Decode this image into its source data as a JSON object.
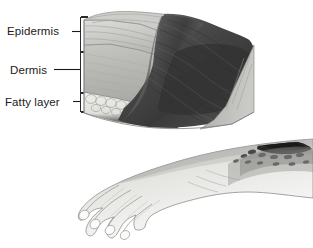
{
  "figure": {
    "background_color": "#ffffff",
    "style": "grayscale medical illustration"
  },
  "labels": [
    {
      "id": "epidermis",
      "text": "Epidermis",
      "layer": "outer skin layer"
    },
    {
      "id": "dermis",
      "text": "Dermis",
      "layer": "middle skin layer"
    },
    {
      "id": "fatty_layer",
      "text": "Fatty layer",
      "layer": "subcutaneous fat layer"
    }
  ],
  "leader_lines": {
    "bracket_color": "#2a2a2a",
    "bracket_x": 80,
    "bracket_top": 17,
    "bracket_bottom": 112,
    "tick_epidermis_y": 31,
    "tick_dermis_y": 69,
    "tick_fatty_y": 101
  },
  "panels": {
    "cross_section": {
      "name": "skin-cross-section-block",
      "description": "Three-dimensional wedge of skin cut away to reveal epidermis, dermis and fatty layer, with dark necrotic burn tissue eroding through the surface",
      "epidermis_color": "#c9c9c7",
      "dermis_color": "#b9b9b6",
      "fatty_layer_color": "#e2e1dd",
      "wound_color": "#4a4a4a",
      "wound_shadow_color": "#2e2e2e",
      "outline_color": "#6d6d6d"
    },
    "limb": {
      "name": "hand-and-forearm",
      "description": "Hand with four fingers extended and forearm bearing a dark eschar burn lesion",
      "skin_color": "#f2f2f0",
      "shade_color": "#b7b7b4",
      "outline_color": "#9a9a97",
      "lesion_color": "#3a3a3a"
    }
  },
  "colors": {
    "ink": "#1b1b1b",
    "background": "#ffffff",
    "mid_gray": "#9e9e9b",
    "dark_gray": "#454545"
  }
}
